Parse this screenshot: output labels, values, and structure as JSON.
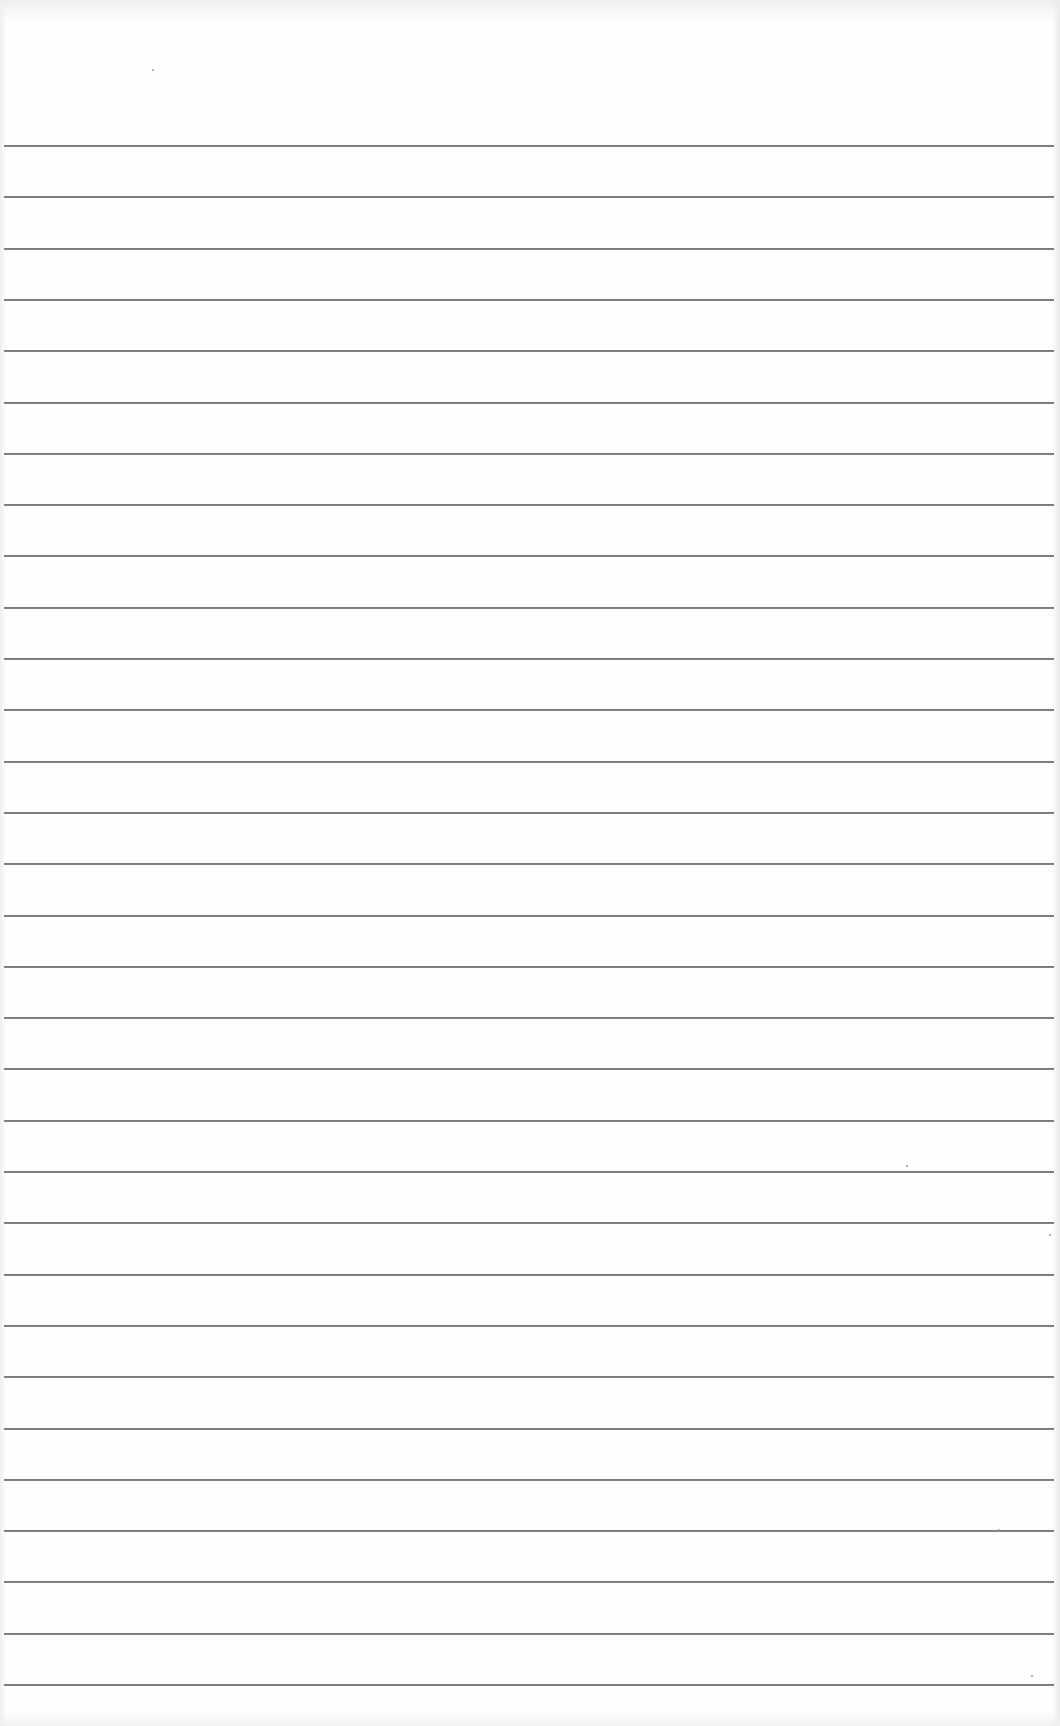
{
  "document": {
    "type": "blank-ruled-notebook-page",
    "background_color": "#fefefe",
    "line_color": "#7a7a7a",
    "ruled_lines": {
      "count": 31,
      "first_y": 145,
      "spacing": 51.3,
      "left_x": 4,
      "right_x": 1054
    },
    "handwritten_text": ""
  }
}
